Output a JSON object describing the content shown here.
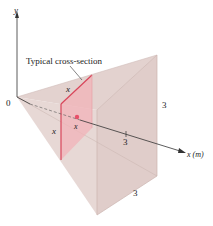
{
  "figure": {
    "axes": {
      "y_label": "y",
      "x_label": "x (m)",
      "origin_label": "0",
      "tick_label": "3"
    },
    "annotation": "Typical cross-section",
    "dimensions": {
      "height_label": "3",
      "depth_label": "3",
      "section_width_label": "x",
      "section_height_label": "x",
      "section_position_label": "x"
    },
    "colors": {
      "solid_fill": "#e4d3d0",
      "solid_dark": "#d6c0bc",
      "section_fill": "#f0b8bc",
      "section_edge": "#d9455a",
      "point": "#e8506a",
      "axis": "#333333"
    }
  }
}
